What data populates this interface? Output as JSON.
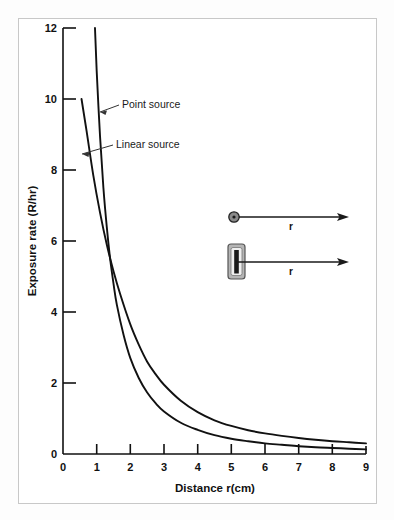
{
  "chart_data": {
    "type": "line",
    "title": "",
    "xlabel": "Distance r(cm)",
    "ylabel": "Exposure rate (R/hr)",
    "xlim": [
      0,
      9
    ],
    "ylim": [
      0,
      12
    ],
    "xticks": [
      "0",
      "1",
      "2",
      "3",
      "4",
      "5",
      "6",
      "7",
      "8",
      "9"
    ],
    "yticks": [
      "0",
      "2",
      "4",
      "6",
      "8",
      "10",
      "12"
    ],
    "grid": false,
    "legend_position": "inline-annotations",
    "series": [
      {
        "name": "Point source",
        "relation": "inverse-square",
        "x": [
          0.95,
          1.0,
          1.1,
          1.2,
          1.3,
          1.4,
          1.5,
          1.6,
          1.8,
          2.0,
          2.25,
          2.5,
          2.75,
          3.0,
          3.5,
          4.0,
          4.5,
          5.0,
          5.5,
          6.0,
          6.5,
          7.0,
          7.5,
          8.0,
          8.5,
          9.0
        ],
        "y": [
          12.0,
          10.8,
          8.95,
          7.5,
          6.4,
          5.5,
          4.8,
          4.2,
          3.35,
          2.7,
          2.14,
          1.73,
          1.43,
          1.2,
          0.88,
          0.68,
          0.53,
          0.43,
          0.36,
          0.3,
          0.26,
          0.22,
          0.19,
          0.17,
          0.15,
          0.13
        ]
      },
      {
        "name": "Linear source",
        "relation": "inverse-distance",
        "x": [
          0.55,
          0.7,
          0.9,
          1.1,
          1.3,
          1.5,
          1.7,
          2.0,
          2.25,
          2.5,
          2.75,
          3.0,
          3.5,
          4.0,
          4.5,
          5.0,
          5.5,
          6.0,
          6.5,
          7.0,
          7.5,
          8.0,
          8.5,
          9.0
        ],
        "y": [
          10.0,
          9.1,
          7.85,
          6.8,
          5.9,
          5.15,
          4.5,
          3.65,
          3.08,
          2.6,
          2.25,
          1.95,
          1.5,
          1.18,
          0.95,
          0.79,
          0.67,
          0.58,
          0.51,
          0.45,
          0.4,
          0.36,
          0.33,
          0.3
        ]
      }
    ],
    "annotations": [
      {
        "text": "Point source",
        "x_px": 119,
        "y_px": 106
      },
      {
        "text": "Linear source",
        "x_px": 113,
        "y_px": 146
      }
    ],
    "colors": {
      "curve": "#111111",
      "axis": "#111111",
      "frame": "#c8c8c8",
      "background": "#ffffff"
    }
  },
  "inset": {
    "point_source": {
      "icon": "filled-circle",
      "arrow_label": "r"
    },
    "linear_source": {
      "icon": "filled-rod-rectangle",
      "arrow_label": "r"
    }
  }
}
